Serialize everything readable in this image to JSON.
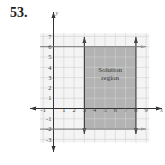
{
  "problem_number": "53.",
  "chart_data": {
    "type": "region",
    "title": "",
    "xlabel": "x",
    "ylabel": "y",
    "x_ticks": [
      -1,
      1,
      2,
      3,
      4,
      5,
      6,
      7,
      8,
      9
    ],
    "y_ticks": [
      7,
      6,
      5,
      4,
      3,
      2,
      1,
      -1,
      -2,
      -3
    ],
    "xlim": [
      -1,
      9
    ],
    "ylim": [
      -3,
      7
    ],
    "grid": true,
    "boundaries": [
      {
        "type": "vertical",
        "x": 3,
        "style": "solid"
      },
      {
        "type": "vertical",
        "x": 8,
        "style": "solid"
      },
      {
        "type": "horizontal",
        "y": 6,
        "style": "solid"
      },
      {
        "type": "horizontal",
        "y": -2,
        "style": "solid"
      }
    ],
    "region": {
      "x_min": 3,
      "x_max": 8,
      "y_min": -2,
      "y_max": 6,
      "fill": "#b3b3b3"
    },
    "annotation": "Solution region",
    "annotation_lines": [
      "Solution",
      "region"
    ]
  }
}
